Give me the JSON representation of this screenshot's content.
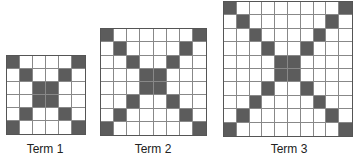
{
  "figure": {
    "terms": [
      {
        "label": "Term 1",
        "size": 6,
        "shaded_cells": [
          [
            0,
            0
          ],
          [
            0,
            5
          ],
          [
            1,
            1
          ],
          [
            1,
            4
          ],
          [
            2,
            2
          ],
          [
            2,
            3
          ],
          [
            3,
            2
          ],
          [
            3,
            3
          ],
          [
            4,
            1
          ],
          [
            4,
            4
          ],
          [
            5,
            0
          ],
          [
            5,
            5
          ]
        ],
        "box": {
          "left": 6,
          "top": 55,
          "width": 80,
          "height": 80
        },
        "label_pos": {
          "x": 45,
          "y": 142
        }
      },
      {
        "label": "Term 2",
        "size": 8,
        "shaded_cells": [
          [
            0,
            0
          ],
          [
            0,
            7
          ],
          [
            1,
            1
          ],
          [
            1,
            6
          ],
          [
            2,
            2
          ],
          [
            2,
            5
          ],
          [
            3,
            3
          ],
          [
            3,
            4
          ],
          [
            4,
            3
          ],
          [
            4,
            4
          ],
          [
            5,
            2
          ],
          [
            5,
            5
          ],
          [
            6,
            1
          ],
          [
            6,
            6
          ],
          [
            7,
            0
          ],
          [
            7,
            7
          ]
        ],
        "box": {
          "left": 100,
          "top": 28,
          "width": 107,
          "height": 108
        },
        "label_pos": {
          "x": 153,
          "y": 142
        }
      },
      {
        "label": "Term 3",
        "size": 10,
        "shaded_cells": [
          [
            0,
            0
          ],
          [
            0,
            9
          ],
          [
            1,
            1
          ],
          [
            1,
            8
          ],
          [
            2,
            2
          ],
          [
            2,
            7
          ],
          [
            3,
            3
          ],
          [
            3,
            6
          ],
          [
            4,
            4
          ],
          [
            4,
            5
          ],
          [
            5,
            4
          ],
          [
            5,
            5
          ],
          [
            6,
            3
          ],
          [
            6,
            6
          ],
          [
            7,
            2
          ],
          [
            7,
            7
          ],
          [
            8,
            1
          ],
          [
            8,
            8
          ],
          [
            9,
            0
          ],
          [
            9,
            9
          ]
        ],
        "box": {
          "left": 223,
          "top": 1,
          "width": 130,
          "height": 136
        },
        "label_pos": {
          "x": 289,
          "y": 142
        }
      }
    ],
    "colors": {
      "shade": "#5c5c5c",
      "grid_line": "#888888",
      "background": "#ffffff"
    }
  }
}
